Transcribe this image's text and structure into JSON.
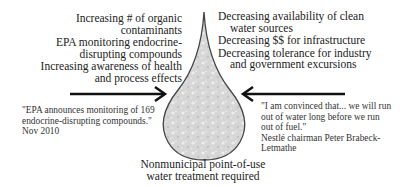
{
  "diagram": {
    "left_factors": [
      "Increasing # of organic contaminants",
      "EPA monitoring endocrine-disrupting compounds",
      "Increasing awareness of health and process effects"
    ],
    "left_factor_lines": [
      [
        "Increasing # of organic",
        "contaminants"
      ],
      [
        "EPA monitoring endocrine-",
        "disrupting compounds"
      ],
      [
        "Increasing awareness of health",
        "and process effects"
      ]
    ],
    "right_factor_lines": [
      [
        "Decreasing availability of clean",
        "water sources"
      ],
      [
        "Decreasing $$ for infrastructure"
      ],
      [
        "Decreasing tolerance for industry",
        "and government excursions"
      ]
    ],
    "left_quote_lines": [
      "\"EPA announces monitoring of 169",
      "endocrine-disrupting compounds.\"",
      "Nov 2010"
    ],
    "right_quote_lines": [
      "\"I am convinced that... we will run",
      "out of water long before we run",
      "out of fuel.\"",
      "Nestlé chairman Peter Brabeck-",
      "Letmathe"
    ],
    "center_label_lines": [
      "Nonmunicipal point-of-use",
      "water treatment required"
    ],
    "drop_fill": "#d9d9d9",
    "drop_stroke": "#444444",
    "arrow_color": "#111111"
  }
}
